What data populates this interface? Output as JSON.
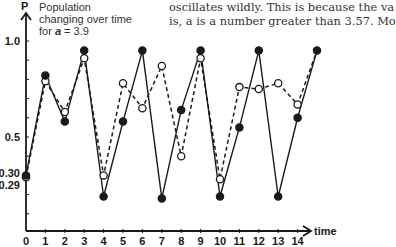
{
  "caption": {
    "line1": "Population",
    "line2": "changing over time",
    "line3_prefix": "for ",
    "line3_var": "a",
    "line3_suffix": " = 3.9"
  },
  "prose": {
    "line1": "oscillates wildly. This is because the va",
    "line2": "is, a is a number greater than 3.57. Mo"
  },
  "chart_data": {
    "type": "line",
    "title": "Population changing over time for a = 3.9",
    "xlabel": "time",
    "ylabel": "P",
    "x": [
      0,
      1,
      2,
      3,
      4,
      5,
      6,
      7,
      8,
      9,
      10,
      11,
      12,
      13,
      14,
      15
    ],
    "x_tick_labels": [
      "0",
      "1",
      "2",
      "3",
      "4",
      "5",
      "6",
      "7",
      "8",
      "9",
      "10",
      "11",
      "12",
      "13",
      "14"
    ],
    "y_tick_labels": [
      "1.0",
      "0.5",
      "0.30",
      "0.29"
    ],
    "xlim": [
      0,
      15
    ],
    "ylim": [
      0,
      1.0
    ],
    "grid": false,
    "series": [
      {
        "name": "P0 = 0.30 (solid line, filled markers)",
        "style": "solid",
        "marker": "filled",
        "values": [
          0.3,
          0.82,
          0.58,
          0.95,
          0.19,
          0.58,
          0.95,
          0.18,
          0.64,
          0.95,
          0.19,
          0.55,
          0.95,
          0.19,
          0.6,
          0.95
        ]
      },
      {
        "name": "P0 = 0.29 (dashed line, open markers)",
        "style": "dashed",
        "marker": "open",
        "values": [
          0.29,
          0.79,
          0.63,
          0.91,
          0.3,
          0.78,
          0.65,
          0.87,
          0.4,
          0.91,
          0.28,
          0.76,
          0.75,
          0.78,
          0.67,
          0.95
        ]
      }
    ]
  },
  "axes": {
    "y_label": "P",
    "x_label": "time",
    "y_ticks": [
      {
        "label": "1.0",
        "value": 1.0
      },
      {
        "label": "0.5",
        "value": 0.5
      },
      {
        "label": "0.30",
        "value": 0.3
      },
      {
        "label": "0.29",
        "value": 0.29
      }
    ],
    "x_ticks": [
      "0",
      "1",
      "2",
      "3",
      "4",
      "5",
      "6",
      "7",
      "8",
      "9",
      "10",
      "11",
      "12",
      "13",
      "14"
    ]
  },
  "colors": {
    "ink": "#1a1a1a",
    "text": "#333333",
    "background": "#ffffff"
  }
}
